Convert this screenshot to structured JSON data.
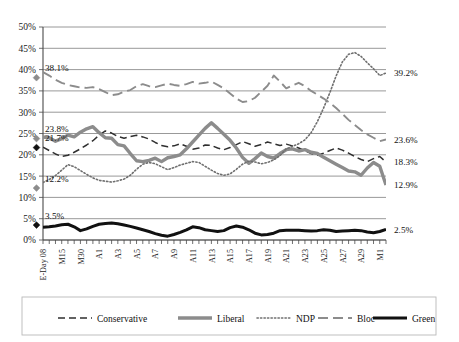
{
  "chart_data": {
    "type": "line",
    "title": "",
    "xlabel": "",
    "ylabel": "",
    "ylim": [
      0,
      50
    ],
    "ytick_labels": [
      "0%",
      "5%",
      "10%",
      "15%",
      "20%",
      "25%",
      "30%",
      "35%",
      "40%",
      "45%",
      "50%"
    ],
    "ytick_values": [
      0,
      5,
      10,
      15,
      20,
      25,
      30,
      35,
      40,
      45,
      50
    ],
    "grid": true,
    "legend_position": "bottom",
    "x_tick_labels": [
      "E-Day 08",
      "M15",
      "M30",
      "A1",
      "A3",
      "A5",
      "A7",
      "A9",
      "A11",
      "A13",
      "A15",
      "A17",
      "A19",
      "A21",
      "A23",
      "A25",
      "A27",
      "A29",
      "M1"
    ],
    "x_tick_indices": [
      0,
      3,
      6,
      9,
      12,
      15,
      18,
      21,
      24,
      27,
      30,
      33,
      36,
      39,
      42,
      45,
      48,
      51,
      54
    ],
    "n_points": 56,
    "start_markers": [
      {
        "series": "Conservative",
        "value": 38.1,
        "label": "38.1%",
        "marker": "diamond-gray"
      },
      {
        "series": "Bloc",
        "value": 23.8,
        "label": "23.8%",
        "marker": "diamond-gray"
      },
      {
        "series": "Liberal",
        "value": 21.7,
        "label": "21.7%",
        "marker": "diamond-black"
      },
      {
        "series": "NDP",
        "value": 12.2,
        "label": "12.2%",
        "marker": "diamond-gray"
      },
      {
        "series": "Green",
        "value": 3.5,
        "label": "3.5%",
        "marker": "diamond-black"
      }
    ],
    "end_labels": [
      {
        "series": "NDP",
        "value": 39.2,
        "label": "39.2%"
      },
      {
        "series": "Bloc",
        "value": 23.6,
        "label": "23.6%"
      },
      {
        "series": "Conservative",
        "value": 18.3,
        "label": "18.3%"
      },
      {
        "series": "Liberal",
        "value": 12.9,
        "label": "12.9%"
      },
      {
        "series": "Green",
        "value": 2.5,
        "label": "2.5%"
      }
    ],
    "series": [
      {
        "name": "Conservative",
        "color": "#2f2f2f",
        "style": "dashed",
        "width": 1.5,
        "values": [
          21.8,
          21.0,
          20.2,
          19.6,
          19.9,
          20.6,
          21.4,
          22.3,
          23.3,
          24.6,
          25.6,
          25.1,
          24.3,
          23.9,
          24.3,
          24.6,
          24.2,
          23.7,
          22.9,
          22.2,
          21.9,
          22.1,
          22.6,
          22.0,
          21.3,
          21.6,
          22.3,
          22.2,
          21.6,
          21.2,
          21.7,
          22.4,
          23.1,
          22.6,
          22.0,
          22.4,
          23.0,
          22.6,
          22.2,
          22.5,
          22.1,
          21.6,
          21.0,
          20.3,
          19.9,
          20.4,
          21.0,
          21.6,
          21.1,
          20.4,
          19.6,
          18.9,
          18.4,
          19.1,
          19.6,
          18.3
        ]
      },
      {
        "name": "Liberal",
        "color": "#8c8c8c",
        "style": "solid-thick",
        "width": 3.4,
        "values": [
          24.2,
          24.0,
          23.2,
          23.8,
          24.6,
          24.2,
          25.3,
          26.1,
          26.6,
          25.2,
          24.0,
          23.9,
          22.4,
          22.1,
          20.3,
          18.6,
          18.4,
          18.7,
          19.2,
          18.4,
          19.3,
          19.6,
          20.0,
          21.4,
          23.0,
          24.6,
          26.2,
          27.5,
          26.2,
          24.8,
          23.4,
          21.6,
          19.4,
          18.0,
          19.1,
          20.4,
          19.6,
          19.2,
          20.3,
          21.2,
          21.4,
          20.9,
          21.2,
          20.6,
          20.3,
          19.4,
          18.6,
          17.8,
          17.0,
          16.2,
          16.0,
          15.2,
          16.9,
          18.2,
          17.3,
          12.9
        ]
      },
      {
        "name": "NDP",
        "color": "#6f6f6f",
        "style": "dotted",
        "width": 1.6,
        "values": [
          13.5,
          14.2,
          15.1,
          16.4,
          17.7,
          17.2,
          16.3,
          15.4,
          14.6,
          14.0,
          13.8,
          13.6,
          13.9,
          14.3,
          15.2,
          16.6,
          17.8,
          18.2,
          17.9,
          17.2,
          16.5,
          17.0,
          17.6,
          18.0,
          18.4,
          18.2,
          17.3,
          16.4,
          15.6,
          15.2,
          15.5,
          16.6,
          17.8,
          18.5,
          18.3,
          17.9,
          18.2,
          18.8,
          19.8,
          21.4,
          22.0,
          22.6,
          23.5,
          25.2,
          27.8,
          31.0,
          34.6,
          38.5,
          41.8,
          43.6,
          44.0,
          43.1,
          41.6,
          40.2,
          38.6,
          39.2
        ]
      },
      {
        "name": "Bloc",
        "color": "#8c8c8c",
        "style": "dashed-long",
        "width": 1.9,
        "values": [
          39.4,
          38.6,
          37.6,
          36.9,
          36.4,
          36.1,
          35.8,
          35.7,
          35.9,
          35.4,
          34.7,
          34.0,
          34.2,
          34.8,
          35.2,
          36.1,
          36.6,
          36.1,
          35.9,
          36.3,
          36.7,
          36.4,
          36.2,
          36.6,
          37.1,
          36.7,
          36.9,
          37.2,
          36.4,
          35.6,
          34.4,
          33.2,
          32.4,
          32.6,
          33.4,
          34.8,
          36.2,
          38.6,
          37.2,
          35.6,
          36.3,
          36.9,
          36.1,
          35.0,
          34.1,
          33.2,
          32.2,
          31.0,
          29.6,
          28.2,
          27.0,
          25.8,
          24.8,
          24.0,
          23.2,
          23.6
        ]
      },
      {
        "name": "Green",
        "color": "#111111",
        "style": "solid-thick",
        "width": 3.0,
        "values": [
          3.0,
          3.1,
          3.3,
          3.6,
          3.7,
          3.1,
          2.2,
          2.6,
          3.2,
          3.7,
          3.9,
          4.0,
          3.8,
          3.5,
          3.2,
          2.8,
          2.4,
          2.0,
          1.5,
          1.1,
          0.9,
          1.3,
          1.8,
          2.4,
          3.1,
          2.9,
          2.4,
          2.2,
          2.0,
          2.2,
          2.9,
          3.3,
          3.0,
          2.4,
          1.6,
          1.2,
          1.3,
          1.6,
          2.2,
          2.3,
          2.3,
          2.3,
          2.2,
          2.1,
          2.2,
          2.4,
          2.3,
          2.0,
          2.1,
          2.2,
          2.3,
          2.2,
          1.9,
          1.7,
          2.0,
          2.5
        ]
      }
    ]
  },
  "legend": {
    "items": [
      {
        "label": "Conservative",
        "swatch": "conservative-swatch"
      },
      {
        "label": "Liberal",
        "swatch": "liberal-swatch"
      },
      {
        "label": "NDP",
        "swatch": "ndp-swatch"
      },
      {
        "label": "Bloc",
        "swatch": "bloc-swatch"
      },
      {
        "label": "Green",
        "swatch": "green-swatch"
      }
    ]
  },
  "colors": {
    "conservative": "#2f2f2f",
    "liberal": "#8c8c8c",
    "ndp": "#6f6f6f",
    "bloc": "#8c8c8c",
    "green": "#111111",
    "grid": "#8d8d8d",
    "axis": "#4a4a4a"
  }
}
